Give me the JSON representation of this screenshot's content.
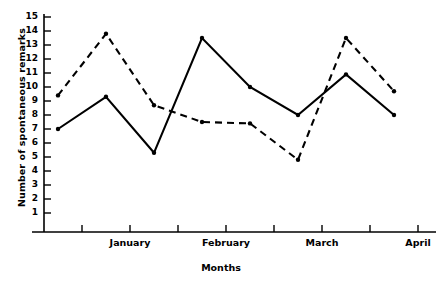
{
  "chart_data": {
    "type": "line",
    "title": "",
    "xlabel": "Months",
    "ylabel": "Number of spontaneous remarks",
    "ylim": [
      0,
      15
    ],
    "yticks": [
      1,
      2,
      3,
      4,
      5,
      6,
      7,
      8,
      9,
      10,
      11,
      12,
      13,
      14,
      15
    ],
    "ytick_labels": [
      "1",
      "2",
      "3",
      "4",
      "5",
      "6",
      "7",
      "8",
      "9",
      "10",
      "11",
      "12",
      "13",
      "14",
      "15"
    ],
    "grid": false,
    "legend": "none",
    "x": [
      1,
      2,
      3,
      4,
      5,
      6,
      7,
      8
    ],
    "xtick_labels": [
      "January",
      "February",
      "March",
      "April"
    ],
    "xtick_label_positions": [
      1.5,
      3.5,
      5.5,
      7.5
    ],
    "series": [
      {
        "name": "solid-line",
        "style": "solid",
        "marker": "dot",
        "color": "#000000",
        "values": [
          7.0,
          9.3,
          5.3,
          13.5,
          10.0,
          8.0,
          10.9,
          8.0
        ]
      },
      {
        "name": "dashed-line",
        "style": "dashed",
        "marker": "dot",
        "color": "#000000",
        "values": [
          9.4,
          13.8,
          8.7,
          7.5,
          7.4,
          4.8,
          13.5,
          9.7
        ]
      }
    ]
  },
  "axis": {
    "y_label": "Number of spontaneous remarks",
    "x_label": "Months"
  }
}
